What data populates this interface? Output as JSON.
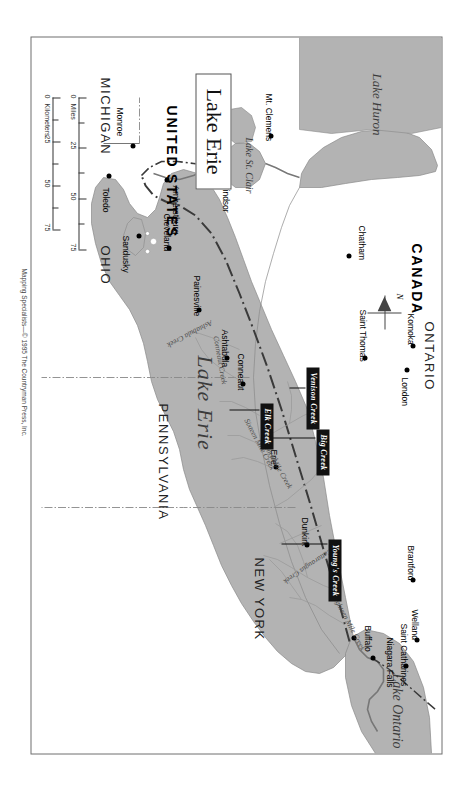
{
  "map": {
    "title": "Lake Erie",
    "credit": "Mapping Specialists—© 1995 The Countryman Press, Inc.",
    "compass_label": "N",
    "colors": {
      "water": "#b3b3b3",
      "land": "#ffffff",
      "border": "#6f6f6f",
      "callout_bg": "#111111",
      "callout_text": "#ffffff",
      "city_dot": "#000000"
    }
  },
  "countries": [
    {
      "name": "CANADA"
    },
    {
      "name": "UNITED STATES"
    }
  ],
  "provinces_states": [
    {
      "name": "ONTARIO"
    },
    {
      "name": "NEW YORK"
    },
    {
      "name": "PENNSYLVANIA"
    },
    {
      "name": "OHIO"
    },
    {
      "name": "MICHIGAN"
    }
  ],
  "waterbodies": [
    {
      "name": "Lake Erie"
    },
    {
      "name": "Lake Ontario"
    },
    {
      "name": "Lake Huron"
    },
    {
      "name": "Lake St. Clair"
    }
  ],
  "cities": [
    {
      "name": "Niagara Falls"
    },
    {
      "name": "Buffalo"
    },
    {
      "name": "Saint Catharines"
    },
    {
      "name": "Welland"
    },
    {
      "name": "Dunkirk"
    },
    {
      "name": "Erie"
    },
    {
      "name": "Brantford"
    },
    {
      "name": "Conneaut"
    },
    {
      "name": "Ashtabula"
    },
    {
      "name": "Painesville"
    },
    {
      "name": "Cleveland"
    },
    {
      "name": "London"
    },
    {
      "name": "Komoka"
    },
    {
      "name": "Saint Thomas"
    },
    {
      "name": "Chatham"
    },
    {
      "name": "Mt. Clemens"
    },
    {
      "name": "Detroit"
    },
    {
      "name": "Windsor"
    },
    {
      "name": "Amherstburg"
    },
    {
      "name": "Monroe"
    },
    {
      "name": "Toledo"
    },
    {
      "name": "Sandusky"
    }
  ],
  "creeks": [
    {
      "name": "Eighteen Mile Creek"
    },
    {
      "name": "Cattaraugus Creek"
    },
    {
      "name": "Twenty Mile Creek"
    },
    {
      "name": "Sixteen Mile Creek"
    },
    {
      "name": "Conneaut Creek"
    },
    {
      "name": "Ashtabula Creek"
    }
  ],
  "highlighted_creeks": [
    {
      "name": "Young's Creek"
    },
    {
      "name": "Big Creek"
    },
    {
      "name": "Venison Creek"
    },
    {
      "name": "Elk Creek"
    }
  ],
  "scale": {
    "miles_label": "Miles",
    "kilometers_label": "Kilometers",
    "miles_ticks": [
      "0",
      "25",
      "50",
      "75"
    ],
    "km_ticks": [
      "0",
      "25",
      "50",
      "75"
    ]
  }
}
